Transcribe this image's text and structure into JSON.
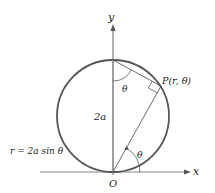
{
  "diagram": {
    "axes": {
      "x_label": "x",
      "y_label": "y",
      "origin_label": "O"
    },
    "labels": {
      "point": "P(r, θ)",
      "diameter": "2a",
      "angle_top": "θ",
      "angle_bottom": "θ",
      "equation": "r = 2a sin θ"
    },
    "colors": {
      "circle": "#555555",
      "axes": "#777777",
      "lines": "#444444",
      "text": "#222222"
    }
  }
}
